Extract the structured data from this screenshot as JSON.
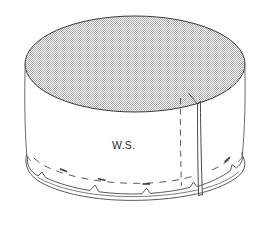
{
  "figure": {
    "kind": "technical-line-drawing",
    "background_color": "#ffffff",
    "line_color": "#3a3a3a",
    "top_fill_color": "#c9c9c9",
    "top_fill_pattern": "halftone-stipple",
    "annotations": [
      {
        "id": "ws",
        "text": "W.S.",
        "meaning": "Wrong Side",
        "x": 135,
        "y": 149,
        "font_size_px": 10.5,
        "color": "#2b2b2b"
      }
    ],
    "parts": {
      "top_disc": {
        "name": "top-disc",
        "shape": "ellipse",
        "center_x": 135,
        "center_y": 64,
        "radius_x": 110,
        "radius_y": 48,
        "filled": true
      },
      "cylinder_wall": {
        "name": "cylinder-wall",
        "height_px": 85,
        "filled": false
      },
      "seam": {
        "name": "overlap-seam",
        "x": 198,
        "top_y": 97,
        "bottom_y": 196,
        "style": "solid-fold"
      },
      "hidden_edge": {
        "name": "hidden-wrapper-edge",
        "x": 181,
        "top_y": 97,
        "bottom_y": 186,
        "style": "dashed"
      },
      "gathered_rim": {
        "name": "gathered-bottom-rim",
        "style": "double-line-with-pleat-notches",
        "notch_count": 8
      },
      "direction_guide": {
        "name": "gather-direction-dashed-arc",
        "style": "dashed-with-arrowheads",
        "arrow_count": 4
      }
    }
  }
}
